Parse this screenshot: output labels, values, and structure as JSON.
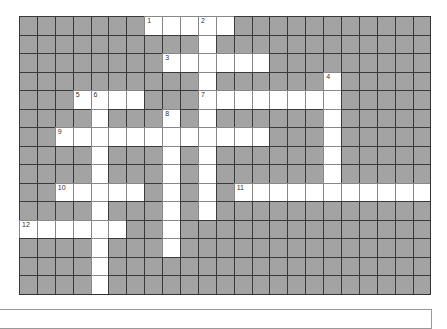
{
  "puzzle": {
    "rows": 15,
    "cols": 23,
    "colors": {
      "block": "#a3a3a3",
      "open": "#ffffff",
      "grid_line": "#3a3a3a"
    },
    "white_cells": {
      "0": [
        7,
        8,
        9,
        10,
        11
      ],
      "1": [
        10
      ],
      "2": [
        8,
        9,
        10,
        11,
        12,
        13
      ],
      "3": [
        10,
        17
      ],
      "4": [
        3,
        4,
        5,
        6,
        10,
        11,
        12,
        13,
        14,
        15,
        16,
        17
      ],
      "5": [
        4,
        8,
        10,
        17
      ],
      "6": [
        2,
        3,
        4,
        5,
        6,
        7,
        8,
        9,
        10,
        11,
        12,
        13,
        17
      ],
      "7": [
        4,
        8,
        10,
        17
      ],
      "8": [
        4,
        8,
        10,
        17
      ],
      "9": [
        2,
        3,
        4,
        5,
        6,
        8,
        10,
        12,
        13,
        14,
        15,
        16,
        17,
        18,
        19,
        20,
        21,
        22
      ],
      "10": [
        4,
        8,
        10
      ],
      "11": [
        0,
        1,
        2,
        3,
        4,
        5,
        8
      ],
      "12": [
        4,
        8
      ],
      "13": [
        4
      ],
      "14": [
        4
      ]
    },
    "clue_numbers": [
      {
        "label": "1",
        "row": 0,
        "col": 7
      },
      {
        "label": "2",
        "row": 0,
        "col": 10
      },
      {
        "label": "3",
        "row": 2,
        "col": 8
      },
      {
        "label": "4",
        "row": 3,
        "col": 17
      },
      {
        "label": "5",
        "row": 4,
        "col": 3
      },
      {
        "label": "6",
        "row": 4,
        "col": 4
      },
      {
        "label": "7",
        "row": 4,
        "col": 10
      },
      {
        "label": "8",
        "row": 5,
        "col": 8
      },
      {
        "label": "9",
        "row": 6,
        "col": 2
      },
      {
        "label": "10",
        "row": 9,
        "col": 2
      },
      {
        "label": "11",
        "row": 9,
        "col": 12
      },
      {
        "label": "12",
        "row": 11,
        "col": 0
      }
    ]
  }
}
